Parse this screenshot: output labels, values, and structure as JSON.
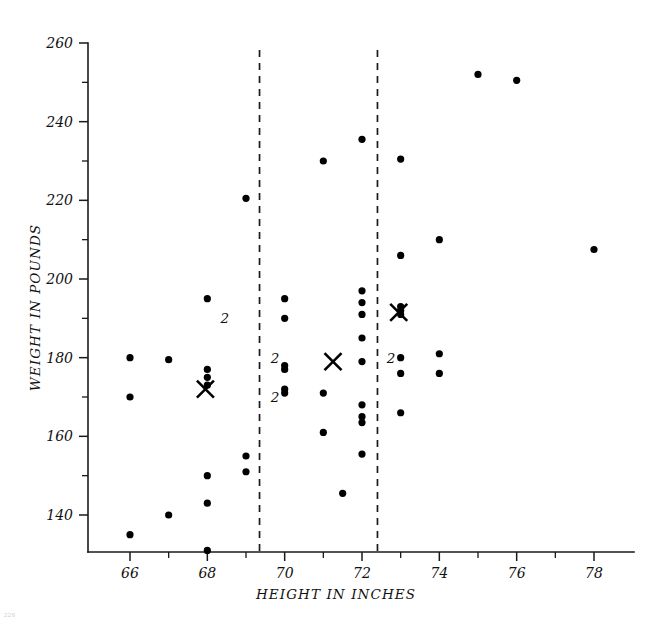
{
  "chart_data": {
    "type": "scatter",
    "title": "",
    "xlabel": "HEIGHT IN INCHES",
    "ylabel": "WEIGHT IN POUNDS",
    "xlim": [
      64.9,
      79.1
    ],
    "ylim": [
      130,
      262
    ],
    "grid": false,
    "legend": null,
    "x_ticks_major": [
      66,
      68,
      70,
      72,
      74,
      76,
      78
    ],
    "x_tick_labels": [
      "66",
      "68",
      "70",
      "72",
      "74",
      "76",
      "78"
    ],
    "x_ticks_minor": [
      67,
      69,
      71,
      73,
      75,
      77
    ],
    "y_ticks_major": [
      140,
      160,
      180,
      200,
      220,
      240,
      260
    ],
    "y_tick_labels": [
      "140",
      "160",
      "180",
      "200",
      "220",
      "240",
      "260"
    ],
    "y_ticks_minor": [
      150,
      170,
      190,
      210,
      230,
      250
    ],
    "group_dividers": [
      69.35,
      72.4
    ],
    "points": [
      {
        "x": 66.0,
        "y": 180
      },
      {
        "x": 66.0,
        "y": 170
      },
      {
        "x": 66.0,
        "y": 135
      },
      {
        "x": 67.0,
        "y": 179.5
      },
      {
        "x": 67.0,
        "y": 140
      },
      {
        "x": 68.0,
        "y": 195
      },
      {
        "x": 68.0,
        "y": 177
      },
      {
        "x": 68.0,
        "y": 175
      },
      {
        "x": 68.0,
        "y": 173
      },
      {
        "x": 68.0,
        "y": 150
      },
      {
        "x": 68.0,
        "y": 143
      },
      {
        "x": 68.0,
        "y": 131
      },
      {
        "x": 69.0,
        "y": 155
      },
      {
        "x": 69.0,
        "y": 151
      },
      {
        "x": 69.0,
        "y": 220.5
      },
      {
        "x": 70.0,
        "y": 195
      },
      {
        "x": 70.0,
        "y": 190
      },
      {
        "x": 70.0,
        "y": 178
      },
      {
        "x": 70.0,
        "y": 177
      },
      {
        "x": 70.0,
        "y": 172
      },
      {
        "x": 70.0,
        "y": 171
      },
      {
        "x": 71.0,
        "y": 230
      },
      {
        "x": 71.0,
        "y": 171
      },
      {
        "x": 71.0,
        "y": 161
      },
      {
        "x": 71.5,
        "y": 145.5
      },
      {
        "x": 72.0,
        "y": 235.5
      },
      {
        "x": 72.0,
        "y": 197
      },
      {
        "x": 72.0,
        "y": 194
      },
      {
        "x": 72.0,
        "y": 191
      },
      {
        "x": 72.0,
        "y": 185
      },
      {
        "x": 72.0,
        "y": 179
      },
      {
        "x": 72.0,
        "y": 168
      },
      {
        "x": 72.0,
        "y": 165
      },
      {
        "x": 72.0,
        "y": 163.5
      },
      {
        "x": 72.0,
        "y": 155.5
      },
      {
        "x": 73.0,
        "y": 230.5
      },
      {
        "x": 73.0,
        "y": 193
      },
      {
        "x": 73.0,
        "y": 192
      },
      {
        "x": 73.0,
        "y": 191
      },
      {
        "x": 73.0,
        "y": 180
      },
      {
        "x": 73.0,
        "y": 176
      },
      {
        "x": 73.0,
        "y": 166
      },
      {
        "x": 73.0,
        "y": 206
      },
      {
        "x": 74.0,
        "y": 210
      },
      {
        "x": 74.0,
        "y": 181
      },
      {
        "x": 74.0,
        "y": 176
      },
      {
        "x": 75.0,
        "y": 252
      },
      {
        "x": 76.0,
        "y": 250.5
      },
      {
        "x": 78.0,
        "y": 207.5
      }
    ],
    "count_labels": [
      {
        "x": 68.45,
        "y": 190,
        "text": "2"
      },
      {
        "x": 69.75,
        "y": 180,
        "text": "2"
      },
      {
        "x": 69.75,
        "y": 170,
        "text": "2"
      },
      {
        "x": 72.75,
        "y": 180,
        "text": "2"
      }
    ],
    "group_means": [
      {
        "x": 67.95,
        "y": 172,
        "marker": "X"
      },
      {
        "x": 71.25,
        "y": 179,
        "marker": "X"
      },
      {
        "x": 72.95,
        "y": 191.5,
        "marker": "X"
      }
    ]
  },
  "figure": {
    "corner_note": "226"
  }
}
